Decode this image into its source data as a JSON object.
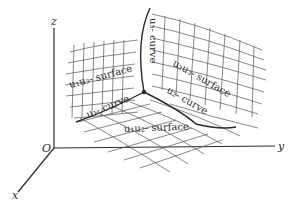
{
  "figure": {
    "type": "curvilinear-coordinate-surfaces",
    "axes": {
      "x": "x",
      "y": "y",
      "z": "z",
      "origin": "O"
    },
    "surfaces": [
      {
        "id": "u1u3",
        "label": "u₁u₃- surface"
      },
      {
        "id": "u2u3",
        "label": "u₂u₃- surface"
      },
      {
        "id": "u1u2",
        "label": "u₁u₂- surface"
      }
    ],
    "curves": [
      {
        "id": "u1",
        "label": "u₁- curve"
      },
      {
        "id": "u2",
        "label": "u₂- curve"
      },
      {
        "id": "u3",
        "label": "u₃- curve"
      }
    ],
    "colors": {
      "line": "#2a2a2a",
      "grid": "#555555",
      "background": "#ffffff"
    }
  }
}
